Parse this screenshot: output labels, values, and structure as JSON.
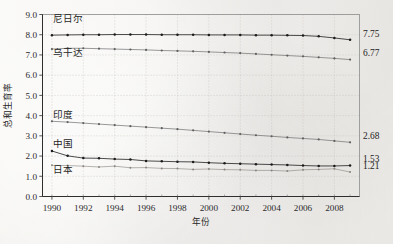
{
  "chart_data": {
    "type": "line",
    "title": "",
    "xlabel": "年份",
    "ylabel": "总和生育率",
    "x": [
      1990,
      1991,
      1992,
      1993,
      1994,
      1995,
      1996,
      1997,
      1998,
      1999,
      2000,
      2001,
      2002,
      2003,
      2004,
      2005,
      2006,
      2007,
      2008,
      2009
    ],
    "xlim": [
      1989.4,
      2009.6
    ],
    "ylim": [
      0.0,
      9.0
    ],
    "xticks": [
      1990,
      1992,
      1994,
      1996,
      1998,
      2000,
      2002,
      2004,
      2006,
      2008
    ],
    "xtick_labels": [
      "1990",
      "1992",
      "1994",
      "1996",
      "1998",
      "2000",
      "2002",
      "2004",
      "2006",
      "2008"
    ],
    "yticks": [
      0.0,
      1.0,
      2.0,
      3.0,
      4.0,
      5.0,
      6.0,
      7.0,
      8.0,
      9.0
    ],
    "ytick_labels": [
      "0.0",
      "1.0",
      "2.0",
      "3.0",
      "4.0",
      "5.0",
      "6.0",
      "7.0",
      "8.0",
      "9.0"
    ],
    "grid": true,
    "legend": "inline-labels-at-line-start",
    "series": [
      {
        "name": "尼日尔",
        "style": "dark",
        "end_value": "7.75",
        "values": [
          7.98,
          7.99,
          8.0,
          8.0,
          8.01,
          8.01,
          8.01,
          8.0,
          8.0,
          8.0,
          7.99,
          7.99,
          7.99,
          7.98,
          7.98,
          7.97,
          7.96,
          7.92,
          7.84,
          7.75
        ]
      },
      {
        "name": "乌干达",
        "style": "mid",
        "end_value": "6.77",
        "values": [
          7.29,
          7.33,
          7.33,
          7.31,
          7.29,
          7.27,
          7.25,
          7.22,
          7.2,
          7.18,
          7.15,
          7.12,
          7.09,
          7.05,
          7.01,
          6.97,
          6.93,
          6.88,
          6.83,
          6.77
        ]
      },
      {
        "name": "印度",
        "style": "mid",
        "end_value": "2.68",
        "values": [
          3.72,
          3.68,
          3.63,
          3.58,
          3.53,
          3.48,
          3.43,
          3.38,
          3.33,
          3.27,
          3.21,
          3.15,
          3.09,
          3.03,
          2.98,
          2.92,
          2.87,
          2.82,
          2.75,
          2.68
        ]
      },
      {
        "name": "中国",
        "style": "dark",
        "end_value": "1.53",
        "values": [
          2.25,
          2.01,
          1.9,
          1.89,
          1.85,
          1.83,
          1.76,
          1.74,
          1.72,
          1.71,
          1.67,
          1.64,
          1.62,
          1.6,
          1.58,
          1.56,
          1.53,
          1.51,
          1.51,
          1.53
        ]
      },
      {
        "name": "日本",
        "style": "light",
        "end_value": "1.21",
        "values": [
          1.54,
          1.53,
          1.5,
          1.46,
          1.5,
          1.42,
          1.43,
          1.39,
          1.38,
          1.34,
          1.36,
          1.33,
          1.32,
          1.29,
          1.29,
          1.26,
          1.32,
          1.34,
          1.37,
          1.21
        ]
      }
    ],
    "series_label_positions": [
      {
        "name": "尼日尔",
        "x": 1990.1,
        "y": 8.62
      },
      {
        "name": "乌干达",
        "x": 1990.1,
        "y": 6.96
      },
      {
        "name": "印度",
        "x": 1990.1,
        "y": 3.86
      },
      {
        "name": "中国",
        "x": 1990.1,
        "y": 2.45
      },
      {
        "name": "日本",
        "x": 1990.1,
        "y": 1.17
      }
    ]
  }
}
